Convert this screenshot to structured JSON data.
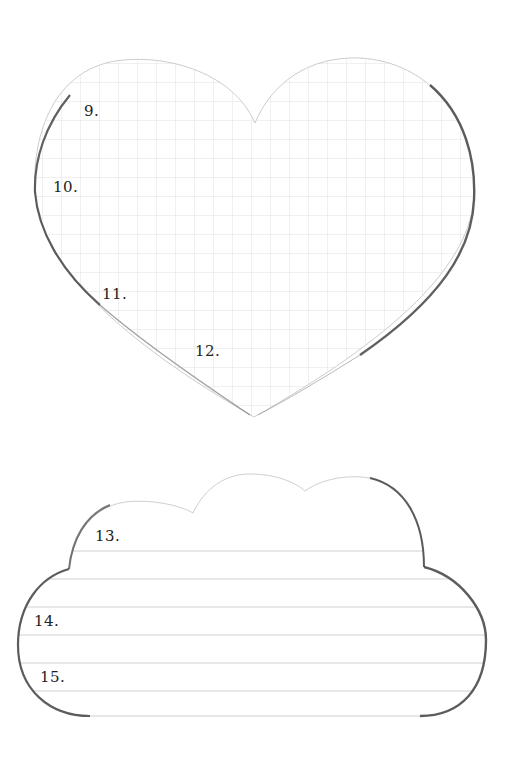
{
  "heart": {
    "shape": "heart",
    "pattern": "grid",
    "grid_color": "#e4e4e4",
    "outline_color": "#c8c8c8",
    "shadow_color": "#3a3a3a",
    "labels": [
      {
        "text": "9.",
        "x": 84,
        "y": 102
      },
      {
        "text": "10.",
        "x": 53,
        "y": 178
      },
      {
        "text": "11.",
        "x": 102,
        "y": 285
      },
      {
        "text": "12.",
        "x": 195,
        "y": 342
      }
    ]
  },
  "cloud": {
    "shape": "cloud",
    "pattern": "ruled-lines",
    "line_color": "#d2d2d2",
    "outline_color": "#cfcfcf",
    "shadow_color": "#3a3a3a",
    "labels": [
      {
        "text": "13.",
        "x": 95,
        "y": 527
      },
      {
        "text": "14.",
        "x": 34,
        "y": 612
      },
      {
        "text": "15.",
        "x": 40,
        "y": 668
      }
    ]
  }
}
